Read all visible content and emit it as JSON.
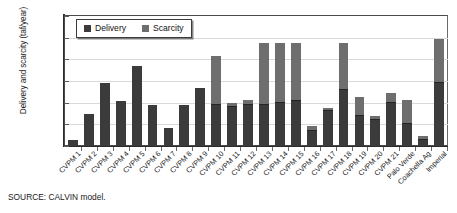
{
  "chart_data": {
    "type": "bar",
    "stacked": true,
    "title": "",
    "xlabel": "",
    "ylabel": "Delivery and scarcity (taf/year)",
    "ylim": [
      0,
      3000
    ],
    "ytick_labels": [
      "0",
      "500",
      "1,000",
      "1,500",
      "2,000",
      "2,500",
      "3,000"
    ],
    "ytick_values": [
      0,
      500,
      1000,
      1500,
      2000,
      2500,
      3000
    ],
    "grid": true,
    "legend_position": "top-left-inside",
    "categories": [
      "CVPM 1",
      "CVPM 2",
      "CVPM 3",
      "CVPM 4",
      "CVPM 5",
      "CVPM 6",
      "CVPM 7",
      "CVPM 8",
      "CVPM 9",
      "CVPM 10",
      "CVPM 11",
      "CVPM 12",
      "CVPM 13",
      "CVPM 14",
      "CVPM 15",
      "CVPM 16",
      "CVPM 17",
      "CVPM 18",
      "CVPM 19",
      "CVPM 20",
      "CVPM 21",
      "Palo Verde",
      "Coachella Ag",
      "Imperial"
    ],
    "series": [
      {
        "name": "Delivery",
        "color": "#3b3b3b",
        "values": [
          150,
          750,
          1450,
          1050,
          1850,
          950,
          420,
          950,
          1350,
          950,
          900,
          950,
          950,
          1000,
          1050,
          350,
          800,
          1300,
          700,
          600,
          1000,
          500,
          150,
          1450
        ]
      },
      {
        "name": "Scarcity",
        "color": "#6e6e6e",
        "values": [
          0,
          0,
          0,
          0,
          0,
          0,
          0,
          0,
          0,
          1100,
          80,
          100,
          1400,
          1350,
          1300,
          100,
          50,
          1050,
          400,
          80,
          200,
          550,
          50,
          1000
        ]
      }
    ],
    "totals": [
      150,
      750,
      1450,
      1050,
      1850,
      950,
      420,
      950,
      1350,
      2050,
      980,
      1050,
      2350,
      2350,
      2350,
      450,
      850,
      2350,
      1100,
      680,
      1200,
      1050,
      200,
      2450
    ]
  },
  "legend": {
    "items": [
      {
        "label": "Delivery",
        "color": "#3b3b3b"
      },
      {
        "label": "Scarcity",
        "color": "#6e6e6e"
      }
    ]
  },
  "source": {
    "text": "SOURCE: CALVIN model."
  }
}
